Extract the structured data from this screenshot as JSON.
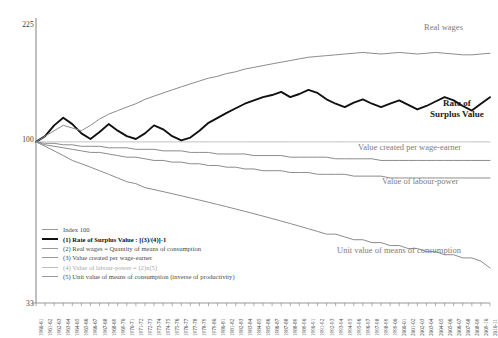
{
  "axis": {
    "y_ticks": [
      "225",
      "100",
      "33"
    ],
    "y_scale": "log",
    "index_line_value": 100
  },
  "annotations": {
    "real_wages": "Real wages",
    "rate_of_surplus_value_line1": "Rate of",
    "rate_of_surplus_value_line2": "Surplus Value",
    "value_created": "Value created per wage-earner",
    "value_of_labour_power": "Value of labour-power",
    "unit_value": "Unit value of means of consumption"
  },
  "legend": {
    "items": [
      {
        "label": "Index 100",
        "style": "plain"
      },
      {
        "label": "(1) Rate of Surplus Value : [(3)/(4)]-1",
        "style": "bold"
      },
      {
        "label": "(2) Real wages = Quantity of means of consumption",
        "style": "plain"
      },
      {
        "label": "(3) Value created per wage-earner",
        "style": "plain"
      },
      {
        "label": "(4) Value of labour-power = (2)x(5)",
        "style": "light"
      },
      {
        "label": "(5) Unit value of means of consumption (inverse of productivity)",
        "style": "plain"
      }
    ]
  },
  "colors": {
    "series_gray": "#8c8c8c",
    "series_black": "#111111",
    "index_line": "#bdbdbd",
    "axis": "#8c8c8c",
    "background": "#ffffff"
  },
  "chart_data": {
    "type": "line",
    "title": "",
    "xlabel": "",
    "ylabel": "",
    "ylim": [
      33,
      225
    ],
    "yscale": "log",
    "grid": false,
    "legend_position": "lower-left",
    "index_base": 100,
    "categories": [
      "1960-61",
      "1961-62",
      "1962-63",
      "1963-64",
      "1964-65",
      "1965-66",
      "1966-67",
      "1967-68",
      "1968-69",
      "1969-70",
      "1970-71",
      "1971-72",
      "1972-73",
      "1973-74",
      "1974-75",
      "1975-76",
      "1976-77",
      "1977-78",
      "1978-79",
      "1979-80",
      "1980-81",
      "1981-82",
      "1982-83",
      "1983-84",
      "1984-85",
      "1985-86",
      "1986-87",
      "1987-88",
      "1988-89",
      "1989-90",
      "1990-91",
      "1991-92",
      "1992-93",
      "1993-94",
      "1994-95",
      "1995-96",
      "1996-97",
      "1997-98",
      "1998-99",
      "1999-00",
      "2000-01",
      "2001-02",
      "2002-03",
      "2003-04",
      "2004-05",
      "2005-06",
      "2006-07",
      "2007-08",
      "2008-09",
      "2009-10",
      "2010-11"
    ],
    "series": [
      {
        "name": "Index 100",
        "key": "index",
        "style": "plain",
        "color": "#bdbdbd",
        "values": [
          100,
          100,
          100,
          100,
          100,
          100,
          100,
          100,
          100,
          100,
          100,
          100,
          100,
          100,
          100,
          100,
          100,
          100,
          100,
          100,
          100,
          100,
          100,
          100,
          100,
          100,
          100,
          100,
          100,
          100,
          100,
          100,
          100,
          100,
          100,
          100,
          100,
          100,
          100,
          100,
          100,
          100,
          100,
          100,
          100,
          100,
          100,
          100,
          100,
          100,
          100
        ]
      },
      {
        "name": "(1) Rate of Surplus Value : [(3)/(4)]-1",
        "key": "rate_of_surplus_value",
        "style": "bold",
        "color": "#111111",
        "values": [
          100,
          104,
          112,
          118,
          113,
          106,
          102,
          107,
          113,
          108,
          104,
          102,
          106,
          112,
          109,
          104,
          101,
          103,
          108,
          114,
          118,
          122,
          126,
          130,
          133,
          136,
          138,
          141,
          136,
          139,
          143,
          140,
          134,
          130,
          127,
          131,
          134,
          130,
          127,
          130,
          133,
          129,
          125,
          128,
          132,
          136,
          133,
          128,
          124,
          130,
          136
        ]
      },
      {
        "name": "(2) Real wages = Quantity of means of consumption",
        "key": "real_wages",
        "style": "plain",
        "color": "#8c8c8c",
        "values": [
          100,
          104,
          108,
          112,
          110,
          108,
          112,
          117,
          121,
          124,
          127,
          130,
          134,
          137,
          140,
          143,
          146,
          149,
          152,
          155,
          157,
          160,
          162,
          165,
          167,
          169,
          171,
          173,
          175,
          177,
          179,
          180,
          181,
          182,
          183,
          184,
          185,
          184,
          183,
          184,
          185,
          184,
          183,
          184,
          185,
          184,
          183,
          182,
          182,
          183,
          184
        ]
      },
      {
        "name": "(3) Value created per wage-earner",
        "key": "value_created_per_wage_earner",
        "style": "plain",
        "color": "#8c8c8c",
        "values": [
          100,
          99,
          99,
          98,
          98,
          97,
          97,
          97,
          96,
          96,
          96,
          95,
          95,
          95,
          94,
          94,
          94,
          93,
          93,
          93,
          92,
          92,
          92,
          92,
          91,
          91,
          91,
          91,
          90,
          90,
          90,
          90,
          90,
          89,
          89,
          89,
          89,
          89,
          88,
          88,
          88,
          88,
          88,
          88,
          88,
          88,
          88,
          88,
          88,
          88,
          88
        ]
      },
      {
        "name": "(4) Value of labour-power = (2)x(5)",
        "key": "value_of_labour_power",
        "style": "light",
        "color": "#8c8c8c",
        "values": [
          100,
          98,
          97,
          96,
          95,
          94,
          93,
          93,
          92,
          91,
          90,
          90,
          89,
          88,
          88,
          87,
          87,
          86,
          86,
          85,
          85,
          84,
          84,
          83,
          83,
          82,
          82,
          82,
          81,
          81,
          81,
          80,
          80,
          80,
          80,
          79,
          79,
          79,
          79,
          78,
          78,
          78,
          78,
          78,
          78,
          78,
          78,
          78,
          78,
          78,
          78
        ]
      },
      {
        "name": "(5) Unit value of means of consumption (inverse of productivity)",
        "key": "unit_value_of_means_of_consumption",
        "style": "plain",
        "color": "#8c8c8c",
        "values": [
          100,
          97,
          94,
          91,
          88,
          86,
          84,
          82,
          80,
          78,
          76,
          75,
          73,
          72,
          71,
          70,
          69,
          68,
          67,
          66,
          65,
          64,
          63,
          62,
          61,
          60,
          59,
          58,
          57,
          56,
          55,
          54,
          53,
          53,
          52,
          51,
          51,
          50,
          50,
          49,
          49,
          48,
          48,
          47,
          47,
          46,
          46,
          45,
          45,
          44,
          42
        ]
      }
    ]
  }
}
